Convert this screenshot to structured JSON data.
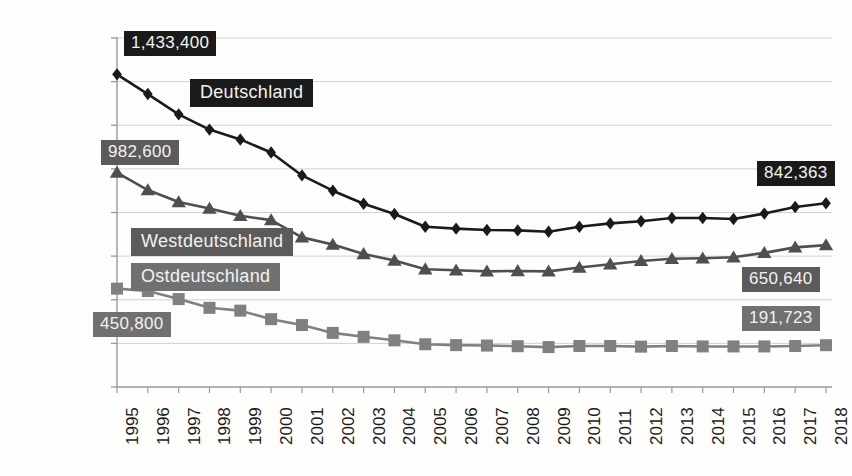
{
  "chart_data": {
    "type": "line",
    "title": "",
    "subtitle": "",
    "xlabel": "",
    "ylabel": "",
    "grid": true,
    "legend_position": "inline-callouts",
    "ylim": [
      0,
      1600000
    ],
    "ytick_labels": [
      "1,600,000",
      "1,400,000",
      "1,200,000",
      "1,000,000",
      "800,000",
      "600,000",
      "400,000",
      "200,000",
      "0"
    ],
    "ytick_values": [
      1600000,
      1400000,
      1200000,
      1000000,
      800000,
      600000,
      400000,
      200000,
      0
    ],
    "categories": [
      "1995",
      "1996",
      "1997",
      "1998",
      "1999",
      "2000",
      "2001",
      "2002",
      "2003",
      "2004",
      "2005",
      "2006",
      "2007",
      "2008",
      "2009",
      "2010",
      "2011",
      "2012",
      "2013",
      "2014",
      "2015",
      "2016",
      "2017",
      "2018"
    ],
    "x": [
      1995,
      1996,
      1997,
      1998,
      1999,
      2000,
      2001,
      2002,
      2003,
      2004,
      2005,
      2006,
      2007,
      2008,
      2009,
      2010,
      2011,
      2012,
      2013,
      2014,
      2015,
      2016,
      2017,
      2018
    ],
    "series": [
      {
        "name": "Deutschland",
        "marker": "diamond",
        "color": "#1a1a1a",
        "values": [
          1433400,
          1343000,
          1250000,
          1180000,
          1135000,
          1075000,
          970000,
          900000,
          840000,
          793000,
          735000,
          726000,
          720000,
          718000,
          712000,
          735000,
          750000,
          760000,
          775000,
          775000,
          770000,
          795000,
          825000,
          842363
        ],
        "start_label": "1,433,400",
        "end_label": "842,363"
      },
      {
        "name": "Westdeutschland",
        "marker": "triangle",
        "color": "#4f4f4f",
        "values": [
          982600,
          903000,
          848000,
          818000,
          785000,
          765000,
          686000,
          653000,
          610000,
          580000,
          540000,
          535000,
          530000,
          532000,
          530000,
          548000,
          563000,
          578000,
          588000,
          590000,
          595000,
          615000,
          640000,
          650640
        ],
        "start_label": "982,600",
        "end_label": "650,640"
      },
      {
        "name": "Ostdeutschland",
        "marker": "square",
        "color": "#808080",
        "values": [
          450800,
          440000,
          403000,
          363000,
          350000,
          311000,
          284000,
          248000,
          230000,
          214000,
          196000,
          192000,
          190000,
          187000,
          183000,
          188000,
          188000,
          185000,
          188000,
          186000,
          186000,
          186000,
          188000,
          191723
        ],
        "start_label": "450,800",
        "end_label": "191,723"
      }
    ],
    "callouts": [
      {
        "text": "1,433,400",
        "style": "dark"
      },
      {
        "text": "982,600",
        "style": "mid"
      },
      {
        "text": "450,800",
        "style": "light"
      },
      {
        "text": "842,363",
        "style": "dark"
      },
      {
        "text": "650,640",
        "style": "mid"
      },
      {
        "text": "191,723",
        "style": "light"
      },
      {
        "text": "Deutschland",
        "style": "dark"
      },
      {
        "text": "Westdeutschland",
        "style": "mid"
      },
      {
        "text": "Ostdeutschland",
        "style": "light"
      }
    ]
  },
  "colors": {
    "deutschland": "#1a1a1a",
    "westdeutschland": "#4f4f4f",
    "ostdeutschland": "#808080",
    "axis": "#9a9a9a",
    "grid": "#d2d2d2",
    "background": "#fdfdfb",
    "text": "#1c1c1c"
  }
}
